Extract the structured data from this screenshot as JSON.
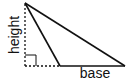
{
  "diagram": {
    "type": "obtuse-triangle-height-base",
    "labels": {
      "height": "height",
      "base": "base"
    },
    "colors": {
      "stroke": "#111111",
      "background": "#ffffff"
    },
    "points": {
      "apex": [
        25,
        3
      ],
      "base_left": [
        60,
        66
      ],
      "base_right": [
        125,
        66
      ],
      "foot": [
        25,
        66
      ]
    }
  }
}
